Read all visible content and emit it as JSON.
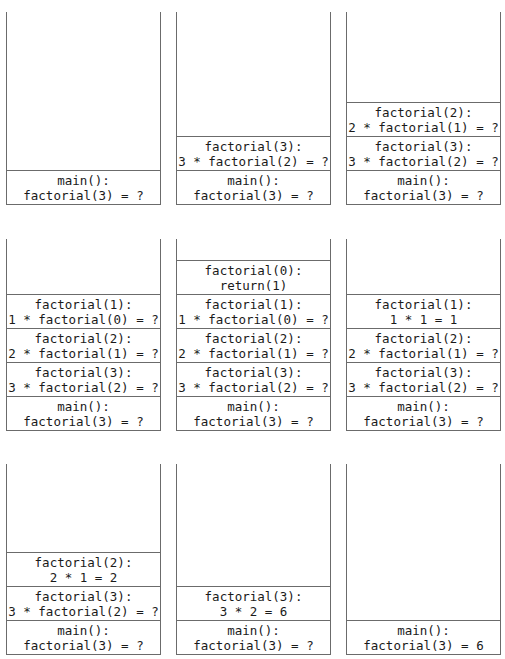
{
  "panels": [
    {
      "frames": [
        {
          "l1": "main():",
          "l2": "factorial(3) = ?"
        }
      ]
    },
    {
      "frames": [
        {
          "l1": "factorial(3):",
          "l2": "3 * factorial(2) = ?"
        },
        {
          "l1": "main():",
          "l2": "factorial(3) = ?"
        }
      ]
    },
    {
      "frames": [
        {
          "l1": "factorial(2):",
          "l2": "2 * factorial(1) = ?"
        },
        {
          "l1": "factorial(3):",
          "l2": "3 * factorial(2) = ?"
        },
        {
          "l1": "main():",
          "l2": "factorial(3) = ?"
        }
      ]
    },
    {
      "frames": [
        {
          "l1": "factorial(1):",
          "l2": "1 * factorial(0) = ?"
        },
        {
          "l1": "factorial(2):",
          "l2": "2 * factorial(1) = ?"
        },
        {
          "l1": "factorial(3):",
          "l2": "3 * factorial(2) = ?"
        },
        {
          "l1": "main():",
          "l2": "factorial(3) = ?"
        }
      ]
    },
    {
      "frames": [
        {
          "l1": "factorial(0):",
          "l2": "return(1)"
        },
        {
          "l1": "factorial(1):",
          "l2": "1 * factorial(0) = ?"
        },
        {
          "l1": "factorial(2):",
          "l2": "2 * factorial(1) = ?"
        },
        {
          "l1": "factorial(3):",
          "l2": "3 * factorial(2) = ?"
        },
        {
          "l1": "main():",
          "l2": "factorial(3) = ?"
        }
      ]
    },
    {
      "frames": [
        {
          "l1": "factorial(1):",
          "l2": "1 * 1 = 1"
        },
        {
          "l1": "factorial(2):",
          "l2": "2 * factorial(1) = ?"
        },
        {
          "l1": "factorial(3):",
          "l2": "3 * factorial(2) = ?"
        },
        {
          "l1": "main():",
          "l2": "factorial(3) = ?"
        }
      ]
    },
    {
      "frames": [
        {
          "l1": "factorial(2):",
          "l2": "2 * 1 = 2"
        },
        {
          "l1": "factorial(3):",
          "l2": "3 * factorial(2) = ?"
        },
        {
          "l1": "main():",
          "l2": "factorial(3) = ?"
        }
      ]
    },
    {
      "frames": [
        {
          "l1": "factorial(3):",
          "l2": "3 * 2 = 6"
        },
        {
          "l1": "main():",
          "l2": "factorial(3) = ?"
        }
      ]
    },
    {
      "frames": [
        {
          "l1": "main():",
          "l2": "factorial(3) = 6"
        }
      ]
    }
  ]
}
